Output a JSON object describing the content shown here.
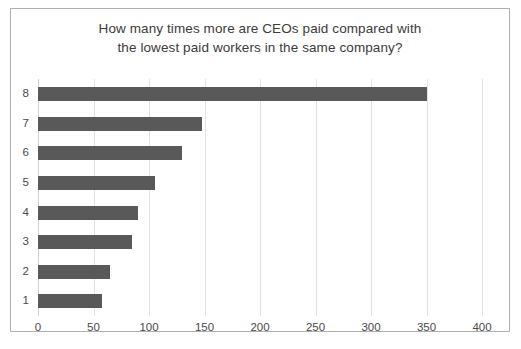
{
  "chart_data": {
    "type": "bar",
    "orientation": "horizontal",
    "title": "How many times more are CEOs paid compared with the lowest paid workers in the same company?",
    "title_lines": [
      "How many times more are CEOs paid compared with",
      "the lowest paid workers in the same company?"
    ],
    "categories": [
      "1",
      "2",
      "3",
      "4",
      "5",
      "6",
      "7",
      "8"
    ],
    "values": [
      58,
      65,
      85,
      90,
      105,
      130,
      148,
      350
    ],
    "xlabel": "",
    "ylabel": "",
    "xlim": [
      0,
      400
    ],
    "xticks": [
      0,
      50,
      100,
      150,
      200,
      250,
      300,
      350,
      400
    ],
    "xtick_labels": [
      "0",
      "50",
      "100",
      "150",
      "200",
      "250",
      "300",
      "350",
      "400"
    ],
    "grid": "vertical",
    "legend": "none",
    "bar_color": "#595959",
    "gridline_color": "#e2e2e2",
    "border_color": "#b0b0b0",
    "text_color": "#4a4a4a"
  }
}
